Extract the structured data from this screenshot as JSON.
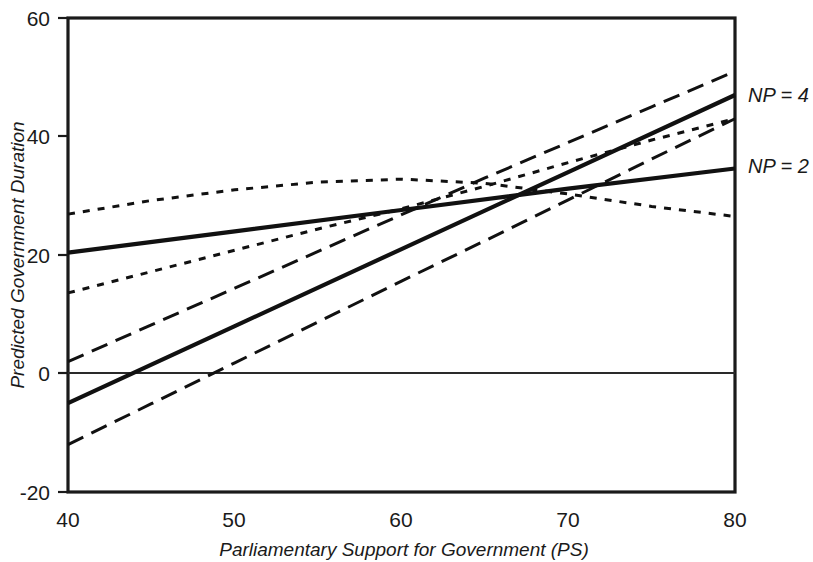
{
  "chart_data": {
    "type": "line",
    "title": "",
    "xlabel": "Parliamentary Support for Government (PS)",
    "ylabel": "Predicted Government Duration",
    "xlim": [
      40,
      80
    ],
    "ylim": [
      -20,
      60
    ],
    "xticks": [
      40,
      50,
      60,
      70,
      80
    ],
    "yticks": [
      -20,
      0,
      20,
      40,
      60
    ],
    "xtick_labels": [
      "40",
      "50",
      "60",
      "70",
      "80"
    ],
    "ytick_labels": [
      "-20",
      "0",
      "20",
      "40",
      "60"
    ],
    "grid": false,
    "legend_position": "right-inline",
    "zero_reference_line": 0,
    "annotations": [
      {
        "text": "NP = 4",
        "x": 80,
        "y": 47,
        "style": "italic"
      },
      {
        "text": "NP = 2",
        "x": 80,
        "y": 34,
        "style": "italic"
      }
    ],
    "series": [
      {
        "name": "NP = 2",
        "style": "solid",
        "role": "prediction",
        "x": [
          40,
          50,
          60,
          70,
          80
        ],
        "values": [
          20.4,
          24.0,
          27.6,
          31.2,
          34.6
        ]
      },
      {
        "name": "NP = 2 upper confidence bound",
        "style": "dotted",
        "role": "confidence-upper",
        "x": [
          40,
          45,
          50,
          55,
          60,
          65,
          70,
          75,
          80
        ],
        "values": [
          26.9,
          29.2,
          31.0,
          32.3,
          32.8,
          32.1,
          30.3,
          28.2,
          26.5
        ]
      },
      {
        "name": "NP = 2 lower confidence bound",
        "style": "dotted",
        "role": "confidence-lower",
        "x": [
          40,
          45,
          50,
          55,
          60,
          65,
          70,
          75,
          80
        ],
        "values": [
          13.6,
          17.2,
          20.8,
          24.4,
          27.8,
          31.6,
          35.6,
          39.4,
          43.0
        ]
      },
      {
        "name": "NP = 4",
        "style": "solid",
        "role": "prediction",
        "x": [
          40,
          50,
          60,
          70,
          80
        ],
        "values": [
          -5.0,
          8.0,
          21.0,
          34.0,
          47.0
        ]
      },
      {
        "name": "NP = 4 upper confidence bound",
        "style": "dashed",
        "role": "confidence-upper",
        "x": [
          40,
          45,
          50,
          55,
          60,
          65,
          70,
          75,
          80
        ],
        "values": [
          2.0,
          8.2,
          14.4,
          20.6,
          26.8,
          33.0,
          39.0,
          45.0,
          51.0
        ]
      },
      {
        "name": "NP = 4 lower confidence bound",
        "style": "dashed",
        "role": "confidence-lower",
        "x": [
          40,
          45,
          50,
          55,
          60,
          65,
          70,
          75,
          80
        ],
        "values": [
          -12.0,
          -5.1,
          1.8,
          8.7,
          15.6,
          22.4,
          29.3,
          36.2,
          43.0
        ]
      }
    ]
  },
  "axes": {
    "x_title": "Parliamentary Support for Government (PS)",
    "y_title": "Predicted Government Duration",
    "x_tick_0": "40",
    "x_tick_1": "50",
    "x_tick_2": "60",
    "x_tick_3": "70",
    "x_tick_4": "80",
    "y_tick_0": "60",
    "y_tick_1": "40",
    "y_tick_2": "20",
    "y_tick_3": "0",
    "y_tick_4": "-20"
  },
  "labels": {
    "np4": "NP = 4",
    "np2": "NP = 2"
  },
  "colors": {
    "ink": "#111111",
    "background": "#ffffff"
  }
}
